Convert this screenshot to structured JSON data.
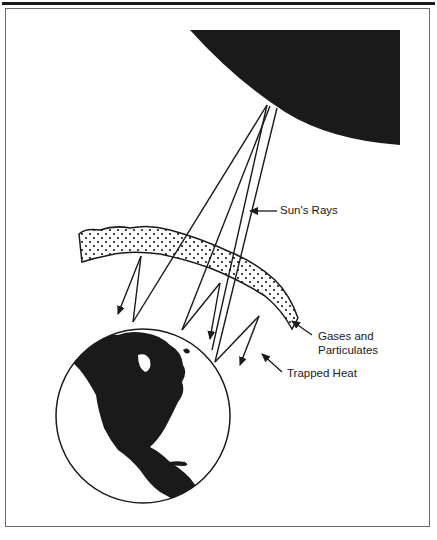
{
  "figure": {
    "type": "greenhouse-effect-diagram",
    "labels": {
      "suns_rays": "Sun's Rays",
      "gases_line1": "Gases and",
      "gases_line2": "Particulates",
      "trapped_heat": "Trapped Heat"
    },
    "elements": [
      "sun",
      "atmosphere-layer",
      "earth",
      "incoming-rays",
      "reflected-heat-arrows"
    ],
    "colors": {
      "ink": "#1a1a1a",
      "background": "#ffffff",
      "frame": "#6a6a6a"
    }
  }
}
